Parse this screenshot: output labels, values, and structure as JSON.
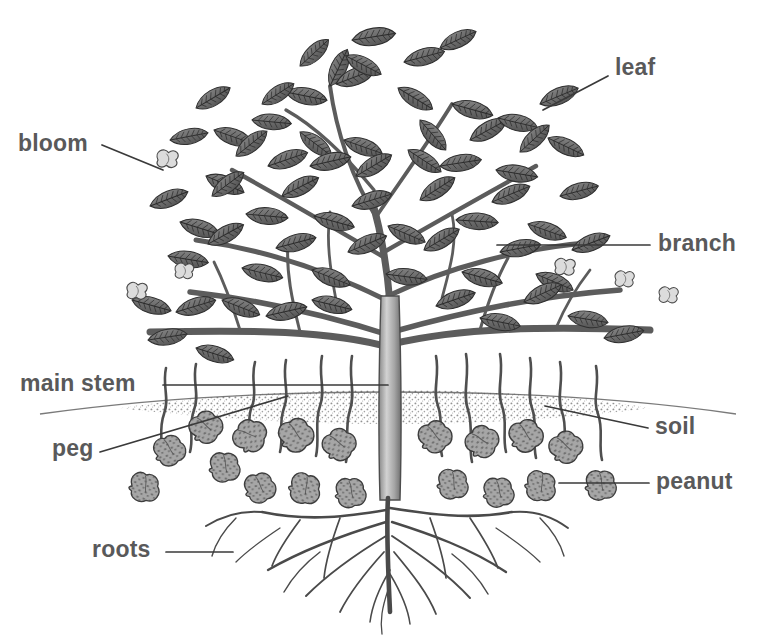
{
  "diagram": {
    "style": "grayscale engraving illustration",
    "background_color": "#ffffff",
    "label_color": "#59595a",
    "leader_line_color": "#3a3a3a",
    "soil_color": "#9a9a9a",
    "pod_color": "#a0a0a0",
    "foliage_color": "#6e6e6e",
    "bloom_color": "#d9d9d9"
  },
  "labels": [
    {
      "id": "bloom",
      "text": "bloom",
      "x": 18,
      "y": 132,
      "anchor": "left"
    },
    {
      "id": "leaf",
      "text": "leaf",
      "x": 615,
      "y": 56,
      "anchor": "left"
    },
    {
      "id": "branch",
      "text": "branch",
      "x": 658,
      "y": 232,
      "anchor": "left"
    },
    {
      "id": "main-stem",
      "text": "main stem",
      "x": 20,
      "y": 372,
      "anchor": "left"
    },
    {
      "id": "peg",
      "text": "peg",
      "x": 52,
      "y": 437,
      "anchor": "left"
    },
    {
      "id": "soil",
      "text": "soil",
      "x": 655,
      "y": 415,
      "anchor": "left"
    },
    {
      "id": "peanut",
      "text": "peanut",
      "x": 656,
      "y": 470,
      "anchor": "left"
    },
    {
      "id": "roots",
      "text": "roots",
      "x": 92,
      "y": 538,
      "anchor": "left"
    }
  ],
  "leader_lines": [
    {
      "id": "bloom-leader",
      "x1": 102,
      "y1": 145,
      "x2": 163,
      "y2": 170
    },
    {
      "id": "leaf-leader",
      "x1": 608,
      "y1": 76,
      "x2": 543,
      "y2": 110
    },
    {
      "id": "branch-leader",
      "x1": 650,
      "y1": 245,
      "x2": 497,
      "y2": 245
    },
    {
      "id": "main-stem-leader",
      "x1": 163,
      "y1": 385,
      "x2": 388,
      "y2": 385
    },
    {
      "id": "peg-leader",
      "x1": 100,
      "y1": 452,
      "x2": 288,
      "y2": 396
    },
    {
      "id": "soil-leader",
      "x1": 648,
      "y1": 428,
      "x2": 545,
      "y2": 406
    },
    {
      "id": "peanut-leader",
      "x1": 649,
      "y1": 483,
      "x2": 559,
      "y2": 483
    },
    {
      "id": "roots-leader",
      "x1": 166,
      "y1": 552,
      "x2": 233,
      "y2": 552
    }
  ],
  "plant_parts": {
    "canopy": {
      "top": 22,
      "bottom": 370,
      "left": 110,
      "right": 655
    },
    "soil_line_y": 408,
    "main_stem": {
      "x": 390,
      "top": 300,
      "bottom": 500,
      "width": 22
    },
    "taproot": {
      "top": 500,
      "bottom": 612
    },
    "peanut_count": 18,
    "bloom_count": 6
  }
}
